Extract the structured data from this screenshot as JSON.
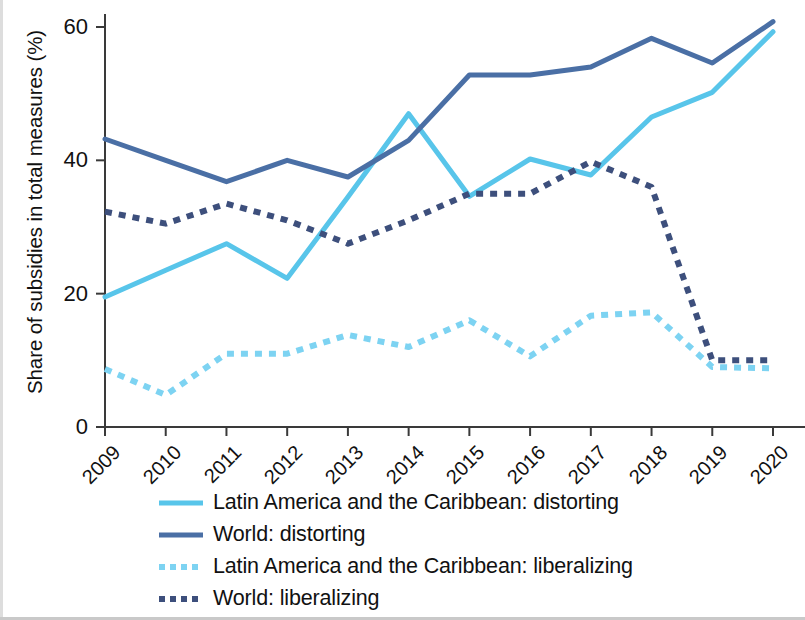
{
  "chart_data": {
    "type": "line",
    "title": "",
    "xlabel": "",
    "ylabel": "Share of subsidies in total measures (%)",
    "categories": [
      "2009",
      "2010",
      "2011",
      "2012",
      "2013",
      "2014",
      "2015",
      "2016",
      "2017",
      "2018",
      "2019",
      "2020"
    ],
    "xlim": [
      2009,
      2020
    ],
    "ylim": [
      0,
      64
    ],
    "yticks": [
      0,
      20,
      40,
      60
    ],
    "ytick_labels": [
      "0",
      "20",
      "40",
      "60"
    ],
    "grid": false,
    "legend_position": "bottom",
    "series": [
      {
        "name": "Latin America and the Caribbean: distorting",
        "color": "#58c5ea",
        "style": "solid",
        "values": [
          19.5,
          23.5,
          27.5,
          22.3,
          34.5,
          47.0,
          34.6,
          40.2,
          37.8,
          46.5,
          50.2,
          59.3
        ]
      },
      {
        "name": "World: distorting",
        "color": "#4a6fa5",
        "style": "solid",
        "values": [
          43.2,
          40.0,
          36.8,
          40.0,
          37.5,
          43.0,
          52.8,
          52.8,
          54.0,
          58.3,
          54.6,
          60.8
        ]
      },
      {
        "name": "Latin America and the Caribbean: liberalizing",
        "color": "#7dd3f2",
        "style": "dotted",
        "values": [
          8.7,
          4.8,
          11.0,
          11.0,
          13.8,
          12.0,
          16.0,
          10.6,
          16.7,
          17.2,
          9.0,
          8.8
        ]
      },
      {
        "name": "World: liberalizing",
        "color": "#3d4f7c",
        "style": "dotted",
        "values": [
          32.3,
          30.5,
          33.5,
          31.0,
          27.5,
          31.0,
          35.0,
          35.0,
          39.8,
          36.0,
          10.0,
          10.0
        ]
      }
    ]
  },
  "legend": {
    "items": [
      {
        "label": "Latin America and the Caribbean: distorting",
        "color": "#58c5ea",
        "style": "solid"
      },
      {
        "label": "World: distorting",
        "color": "#4a6fa5",
        "style": "solid"
      },
      {
        "label": "Latin America and the Caribbean: liberalizing",
        "color": "#7dd3f2",
        "style": "dotted"
      },
      {
        "label": "World: liberalizing",
        "color": "#3d4f7c",
        "style": "dotted"
      }
    ]
  },
  "axis": {
    "y_title": "Share of subsidies in total measures (%)",
    "y_tick_labels": [
      "60",
      "40",
      "20",
      "0"
    ],
    "x_tick_labels": [
      "2009",
      "2010",
      "2011",
      "2012",
      "2013",
      "2014",
      "2015",
      "2016",
      "2017",
      "2018",
      "2019",
      "2020"
    ]
  },
  "colors": {
    "lac_distorting": "#58c5ea",
    "world_distorting": "#4a6fa5",
    "lac_liberalizing": "#7dd3f2",
    "world_liberalizing": "#3d4f7c",
    "axis": "#3a3a3a",
    "text": "#111111"
  }
}
